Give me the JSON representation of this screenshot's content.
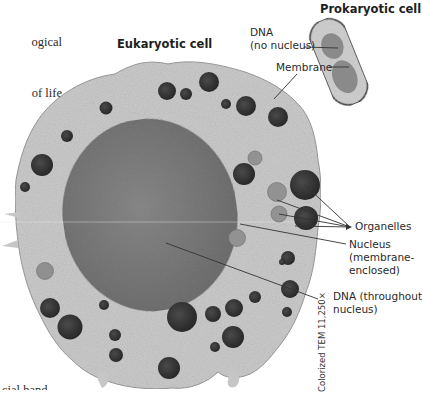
{
  "body_text": {
    "lines": [
      "ogical",
      "of life",
      "orm all",
      "ernal",
      "s en-"
    ],
    "bottom_fragment": "cial band"
  },
  "titles": {
    "eukaryotic": "Eukaryotic cell",
    "prokaryotic": "Prokaryotic cell"
  },
  "prokaryotic_labels": {
    "dna": "DNA\n(no nucleus)",
    "membrane": "Membrane"
  },
  "eukaryotic_labels": {
    "organelles": "Organelles",
    "nucleus": "Nucleus\n(membrane-\nenclosed)",
    "dna": "DNA (throughout\nnucleus)"
  },
  "caption": "Colorized TEM 11,250×",
  "colors": {
    "cytoplasm": "#c9c9c9",
    "nucleus": "#7e7e7e",
    "organelle_dark": "#3a3a3a",
    "organelle_light": "#8f8f8f",
    "leader_line": "#333333",
    "bacterium_fill": "#cfcfcf",
    "bacterium_dna": "#8a8a8a"
  }
}
